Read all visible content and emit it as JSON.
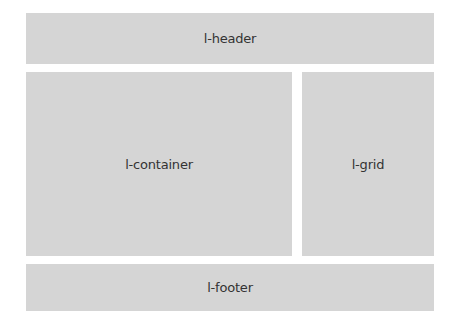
{
  "diagram": {
    "type": "layout-wireframe",
    "colors": {
      "box": "#d5d5d5",
      "text": "#333333",
      "background": "#ffffff"
    },
    "regions": {
      "header": {
        "label": "l-header"
      },
      "container": {
        "label": "l-container"
      },
      "grid": {
        "label": "l-grid"
      },
      "footer": {
        "label": "l-footer"
      }
    }
  }
}
